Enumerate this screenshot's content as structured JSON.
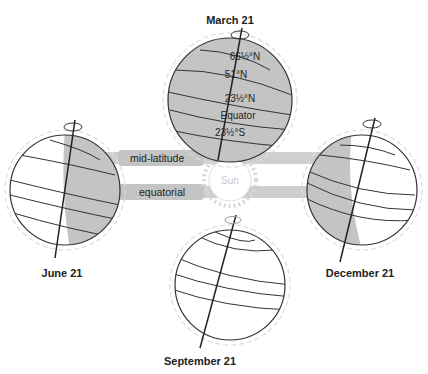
{
  "diagram": {
    "title_cropped": "",
    "sun": {
      "label": "Sun"
    },
    "beams": [
      {
        "label": "mid-latitude"
      },
      {
        "label": "equatorial"
      }
    ],
    "globes": [
      {
        "id": "march",
        "label": "March 21",
        "latitudes": [
          "66½°N",
          "51°N",
          "23½°N",
          "Equator",
          "23½°S"
        ]
      },
      {
        "id": "june",
        "label": "June 21"
      },
      {
        "id": "december",
        "label": "December 21"
      },
      {
        "id": "september",
        "label": "September 21"
      }
    ],
    "colors": {
      "shade": "#c4c4c4",
      "line": "#333333",
      "beam": "#cfcfcf",
      "halo": "#dddddd"
    }
  }
}
